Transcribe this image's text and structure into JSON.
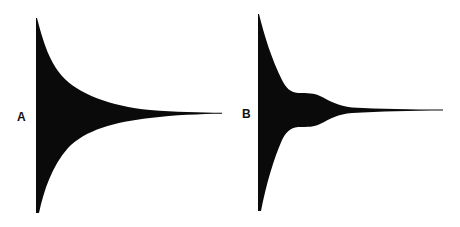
{
  "figure": {
    "panels": [
      {
        "label": "A",
        "description": "Simple exponentially decaying envelope",
        "fill": "#0a0a0a"
      },
      {
        "label": "B",
        "description": "Decaying envelope with a secondary bump/plateau before final decay",
        "fill": "#0a0a0a"
      }
    ]
  }
}
